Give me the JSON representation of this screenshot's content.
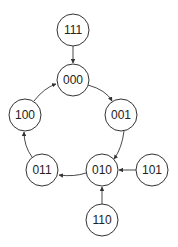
{
  "diagram": {
    "type": "state-transition-graph",
    "node_radius": 16,
    "nodes": [
      {
        "id": "111",
        "label": "111",
        "x": 73,
        "y": 30
      },
      {
        "id": "000",
        "label": "000",
        "x": 73,
        "y": 80
      },
      {
        "id": "001",
        "label": "001",
        "x": 121,
        "y": 115
      },
      {
        "id": "100",
        "label": "100",
        "x": 25,
        "y": 115
      },
      {
        "id": "011",
        "label": "011",
        "x": 42,
        "y": 170
      },
      {
        "id": "010",
        "label": "010",
        "x": 102,
        "y": 170
      },
      {
        "id": "101",
        "label": "101",
        "x": 152,
        "y": 170
      },
      {
        "id": "110",
        "label": "110",
        "x": 102,
        "y": 220
      }
    ],
    "edges": [
      {
        "from": "111",
        "to": "000"
      },
      {
        "from": "000",
        "to": "001"
      },
      {
        "from": "001",
        "to": "010"
      },
      {
        "from": "101",
        "to": "010"
      },
      {
        "from": "110",
        "to": "010"
      },
      {
        "from": "010",
        "to": "011"
      },
      {
        "from": "011",
        "to": "100"
      },
      {
        "from": "100",
        "to": "000"
      }
    ]
  }
}
